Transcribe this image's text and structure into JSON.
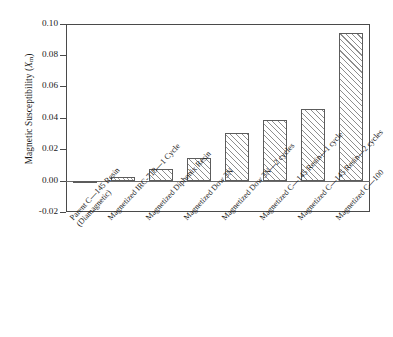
{
  "chart_data": {
    "type": "bar",
    "title": "",
    "xlabel": "",
    "ylabel": "Magnetic Susceptibility (Xm)",
    "ylabel_main": "Magnetic Susceptibility (",
    "ylabel_symbol": "X",
    "ylabel_sub": "m",
    "ylabel_close": ")",
    "ylim": [
      -0.02,
      0.1
    ],
    "ytick_labels": [
      "0.10",
      "0.08",
      "0.06",
      "0.04",
      "0.02",
      "0.00",
      "-0.02"
    ],
    "ytick_values": [
      0.1,
      0.08,
      0.06,
      0.04,
      0.02,
      0.0,
      -0.02
    ],
    "grid": false,
    "legend": false,
    "categories": [
      "Parent C—145 Resin (Diamagnetic)",
      "Magnetized IRC-718—1 Cycle",
      "Magnetized Diphonix Resin",
      "Magnetized Dow 3N",
      "Magnetized Dow 3N—2 cycles",
      "Magnetized C—145 Resin—1 cycle",
      "Magnetized C—145 Resin—2 cycles",
      "Magnetized C—100"
    ],
    "category_lines": [
      [
        "Parent C—145 Resin",
        "(Diamagnetic)"
      ],
      [
        "Magnetized IRC-718—1 Cycle",
        ""
      ],
      [
        "Magnetized Diphonix Resin",
        ""
      ],
      [
        "Magnetized Dow 3N",
        ""
      ],
      [
        "Magnetized Dow 3N—2 cycles",
        ""
      ],
      [
        "Magnetized C—145 Resin—1 cycle",
        ""
      ],
      [
        "Magnetized C—145 Resin—2 cycles",
        ""
      ],
      [
        "Magnetized C—100",
        ""
      ]
    ],
    "values": [
      -0.0015,
      0.0022,
      0.0073,
      0.0145,
      0.0305,
      0.039,
      0.046,
      0.094
    ],
    "bar_facecolor": "#ffffff",
    "bar_edgecolor": "#5c5c5c",
    "hatch": "/",
    "axis_color": "#4a4a4a"
  }
}
